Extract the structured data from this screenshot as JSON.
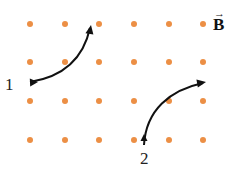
{
  "figure": {
    "field_label": "B",
    "field_vector_symbol": "→",
    "field_direction": "out of page (dots)",
    "dot_color": "#ec8f45",
    "path_color": "#111111",
    "dot_grid": {
      "columns_x": [
        30,
        65,
        99,
        134,
        169,
        203
      ],
      "rows_y": [
        24,
        62,
        101,
        140
      ],
      "radius": 3
    },
    "paths": [
      {
        "label": "1",
        "label_pos": [
          5,
          90
        ],
        "d": "M 30 82 C 55 78, 82 65, 90 28",
        "arrow_tip": [
          91,
          25
        ],
        "arrow_angle": -80
      },
      {
        "label": "2",
        "label_pos": [
          140,
          164
        ],
        "d": "M 144 145 C 146 110, 170 90, 203 83",
        "arrow_tip": [
          206,
          82
        ],
        "arrow_angle": -10
      }
    ]
  }
}
